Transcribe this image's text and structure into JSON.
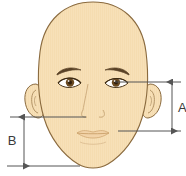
{
  "diagram": {
    "background_color": "#ffffff"
  },
  "colors": {
    "skin_fill": "#f7e0b8",
    "skin_outline": "#8a6a3e",
    "hair_brow": "#5a4226",
    "eye_iris": "#6b4a22",
    "eye_pupil": "#3a2813",
    "eye_outline": "#4a3418",
    "nose_line": "#c9a878",
    "lip_line": "#d8b88c",
    "measure_line": "#555555",
    "measure_text": "#3a3a3a"
  },
  "measurements": [
    {
      "id": "A",
      "label": "A",
      "side": "right",
      "description": "Vertical distance from eye line to mouth line",
      "label_x": 178,
      "label_y": 112,
      "arrow_x": 172,
      "arrow_top_y": 82,
      "arrow_bottom_y": 131,
      "guide_top": {
        "x1": 115,
        "y1": 82,
        "x2": 181,
        "y2": 82
      },
      "guide_bottom": {
        "x1": 118,
        "y1": 131,
        "x2": 181,
        "y2": 131
      }
    },
    {
      "id": "B",
      "label": "B",
      "side": "left",
      "description": "Vertical distance from nose line to chin base line",
      "label_x": 12,
      "label_y": 145,
      "arrow_x": 24,
      "arrow_top_y": 117,
      "arrow_bottom_y": 166,
      "guide_top": {
        "x1": 10,
        "y1": 117,
        "x2": 86,
        "y2": 117
      },
      "guide_bottom": {
        "x1": 7,
        "y1": 166,
        "x2": 80,
        "y2": 166
      }
    }
  ],
  "face_parts": [
    {
      "name": "head-outline",
      "interactable": false
    },
    {
      "name": "left-ear",
      "interactable": false
    },
    {
      "name": "right-ear",
      "interactable": false
    },
    {
      "name": "left-eyebrow",
      "interactable": false
    },
    {
      "name": "right-eyebrow",
      "interactable": false
    },
    {
      "name": "left-eye",
      "interactable": false
    },
    {
      "name": "right-eye",
      "interactable": false
    },
    {
      "name": "nose",
      "interactable": false
    },
    {
      "name": "mouth",
      "interactable": false
    }
  ]
}
